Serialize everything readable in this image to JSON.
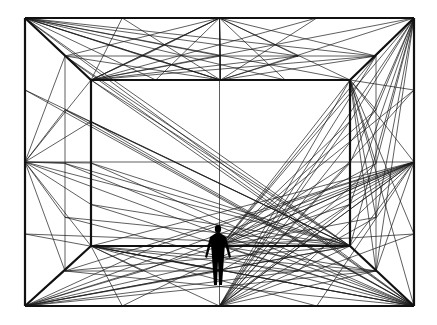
{
  "illustration": {
    "description": "Perspective line drawing of a room with a human silhouette",
    "colors": {
      "background": "#ffffff",
      "line": "#1a1a1a",
      "figure": "#000000"
    },
    "outer_frame": {
      "x1": 25,
      "y1": 18,
      "x2": 414,
      "y2": 306
    },
    "inner_frame": {
      "x1": 91,
      "y1": 80,
      "x2": 350,
      "y2": 246
    },
    "mid_frame": {
      "x1": 65,
      "y1": 56,
      "x2": 376,
      "y2": 271
    },
    "figure": {
      "cx": 218,
      "head_y": 229,
      "feet_y": 285
    }
  }
}
